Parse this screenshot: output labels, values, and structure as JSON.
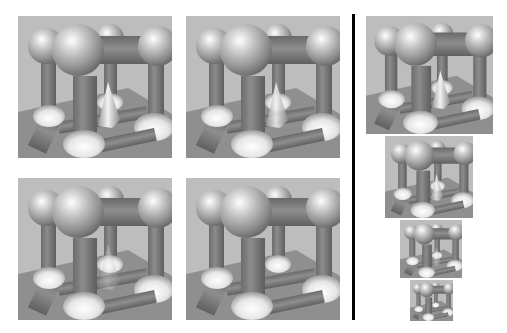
{
  "figure": {
    "left_grid": [
      {
        "id": "a",
        "cone_visible": true,
        "x": 18,
        "y": 16,
        "w": 154,
        "h": 142
      },
      {
        "id": "b",
        "cone_visible": true,
        "x": 186,
        "y": 16,
        "w": 154,
        "h": 142
      },
      {
        "id": "c",
        "cone_visible": true,
        "cone_faint": true,
        "x": 18,
        "y": 178,
        "w": 154,
        "h": 142
      },
      {
        "id": "d",
        "cone_visible": false,
        "x": 186,
        "y": 178,
        "w": 154,
        "h": 142
      }
    ],
    "divider": {
      "x": 352,
      "y": 14,
      "w": 3,
      "h": 306,
      "color": "#000000"
    },
    "pyramid": [
      {
        "level": 0,
        "x": 366,
        "y": 16,
        "w": 127,
        "h": 118
      },
      {
        "level": 1,
        "x": 385,
        "y": 136,
        "w": 88,
        "h": 82
      },
      {
        "level": 2,
        "x": 400,
        "y": 220,
        "w": 62,
        "h": 58
      },
      {
        "level": 3,
        "x": 410,
        "y": 280,
        "w": 43,
        "h": 41
      }
    ],
    "colors": {
      "background": "#ffffff",
      "wall": "#bdbdbd",
      "floor": "#8f8f8f",
      "cylinder": "#7a7a7a",
      "sphere_highlight": "#f4f4f4",
      "sphere_shadow": "#6e6e6e"
    }
  }
}
